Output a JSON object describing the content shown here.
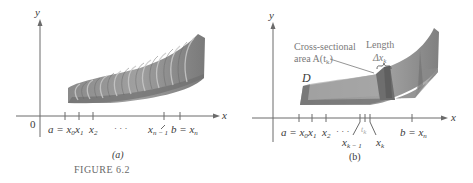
{
  "figure": {
    "title": "FIGURE 6.2",
    "panel_a": {
      "caption": "(a)",
      "y_axis_label": "y",
      "x_axis_label": "x",
      "origin_label": "0",
      "tick_labels": {
        "a_eq_x0": "a = x",
        "a_eq_x0_sub": "0",
        "x1": "x",
        "x1_sub": "1",
        "x2": "x",
        "x2_sub": "2",
        "dots": "· · ·",
        "xn_minus_1": "x",
        "xn_minus_1_sub": "n − 1",
        "b_eq_xn": "b = x",
        "b_eq_xn_sub": "n"
      }
    },
    "panel_b": {
      "caption": "(b)",
      "y_axis_label": "y",
      "x_axis_label": "x",
      "solid_label": "D",
      "cross_section_label_line1": "Cross-sectional",
      "cross_section_label_line2": "area A(t",
      "cross_section_label_sub": "k",
      "cross_section_label_end": ")",
      "length_label": "Length",
      "delta_label": "Δx",
      "delta_sub": "k",
      "tick_labels": {
        "a_eq_x0": "a = x",
        "a_eq_x0_sub": "0",
        "x1": "x",
        "x1_sub": "1",
        "x2": "x",
        "x2_sub": "2",
        "dots": "· · ·",
        "xk_minus_1": "x",
        "xk_minus_1_sub": "k − 1",
        "tk": "t",
        "tk_sub": "k",
        "xk": "x",
        "xk_sub": "k",
        "b_eq_xn": "b = x",
        "b_eq_xn_sub": "n"
      }
    },
    "colors": {
      "axis": "#6b6b6b",
      "solid_dark": "#7d7d7d",
      "solid_mid": "#9a9a9a",
      "solid_light": "#b5b5b5",
      "label_gray": "#7a7a7a"
    }
  }
}
